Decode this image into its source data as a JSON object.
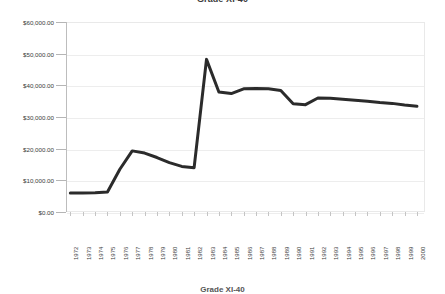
{
  "chart_data": {
    "type": "line",
    "title": "Grade XI-40",
    "xlabel": "",
    "ylabel": "",
    "legend_label": "Grade XI-40",
    "legend_position": "bottom",
    "grid": true,
    "ylim": [
      0,
      60000
    ],
    "y_tick_values": [
      60000,
      50000,
      40000,
      30000,
      20000,
      10000,
      0
    ],
    "y_tick_labels": [
      "$60,000.00",
      "$50,000.00",
      "$40,000.00",
      "$30,000.00",
      "$20,000.00",
      "$10,000.00",
      "$0.00"
    ],
    "categories": [
      "1972",
      "1973",
      "1974",
      "1975",
      "1976",
      "1977",
      "1978",
      "1979",
      "1980",
      "1981",
      "1982",
      "1983",
      "1984",
      "1985",
      "1986",
      "1987",
      "1988",
      "1989",
      "1990",
      "1991",
      "1992",
      "1993",
      "1994",
      "1995",
      "1996",
      "1997",
      "1998",
      "1999",
      "2000"
    ],
    "series": [
      {
        "name": "Grade XI-40",
        "color": "#2b2b2b",
        "line_width": 3,
        "values": [
          6000,
          6000,
          6100,
          6300,
          13500,
          19300,
          18600,
          17200,
          15600,
          14400,
          14000,
          48200,
          37900,
          37400,
          38900,
          39000,
          38900,
          38400,
          34200,
          33900,
          36000,
          35900,
          35600,
          35300,
          35000,
          34600,
          34300,
          33800,
          33400
        ]
      }
    ]
  },
  "axes": {
    "y_axis_name": "currency-axis",
    "x_axis_name": "year-axis"
  }
}
